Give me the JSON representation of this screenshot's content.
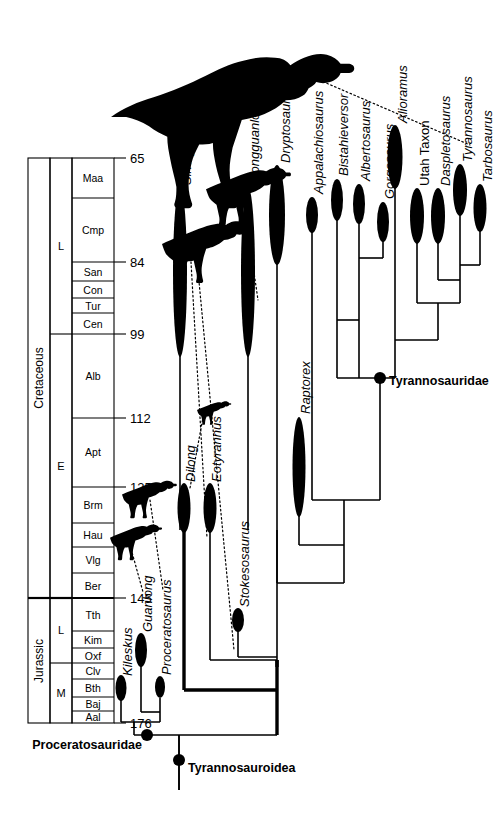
{
  "figure": {
    "type": "cladogram-timescale"
  },
  "axis": {
    "unit": "Ma",
    "tick_labels": [
      "65",
      "84",
      "99",
      "112",
      "125",
      "145",
      "176"
    ],
    "ticks": [
      {
        "label": "65",
        "value": 65
      },
      {
        "label": "84",
        "value": 84
      },
      {
        "label": "99",
        "value": 99
      },
      {
        "label": "112",
        "value": 112
      },
      {
        "label": "125",
        "value": 125
      },
      {
        "label": "145",
        "value": 145
      },
      {
        "label": "176",
        "value": 176
      }
    ]
  },
  "timescale": {
    "periods": [
      {
        "name": "Cretaceous",
        "top": 65,
        "bottom": 145
      },
      {
        "name": "Jurassic",
        "top": 145,
        "bottom": 176
      }
    ],
    "epochs": [
      {
        "name": "L",
        "period": "Cretaceous",
        "top": 65,
        "bottom": 99
      },
      {
        "name": "E",
        "period": "Cretaceous",
        "top": 99,
        "bottom": 145
      },
      {
        "name": "L",
        "period": "Jurassic",
        "top": 145,
        "bottom": 161
      },
      {
        "name": "M",
        "period": "Jurassic",
        "top": 161,
        "bottom": 176
      }
    ],
    "stages": [
      {
        "name": "Maa",
        "top": 65,
        "bottom": 70.6
      },
      {
        "name": "Cmp",
        "top": 70.6,
        "bottom": 84
      },
      {
        "name": "San",
        "top": 84,
        "bottom": 86
      },
      {
        "name": "Con",
        "top": 86,
        "bottom": 88.5
      },
      {
        "name": "Tur",
        "top": 88.5,
        "bottom": 91
      },
      {
        "name": "Cen",
        "top": 91,
        "bottom": 99
      },
      {
        "name": "Alb",
        "top": 99,
        "bottom": 112
      },
      {
        "name": "Apt",
        "top": 112,
        "bottom": 125
      },
      {
        "name": "Brm",
        "top": 125,
        "bottom": 130
      },
      {
        "name": "Hau",
        "top": 130,
        "bottom": 134
      },
      {
        "name": "Vlg",
        "top": 134,
        "bottom": 140
      },
      {
        "name": "Ber",
        "top": 140,
        "bottom": 145
      },
      {
        "name": "Tth",
        "top": 145,
        "bottom": 151
      },
      {
        "name": "Kim",
        "top": 151,
        "bottom": 155
      },
      {
        "name": "Oxf",
        "top": 155,
        "bottom": 158
      },
      {
        "name": "Clv",
        "top": 158,
        "bottom": 162
      },
      {
        "name": "Bth",
        "top": 162,
        "bottom": 167
      },
      {
        "name": "Baj",
        "top": 167,
        "bottom": 171
      },
      {
        "name": "Aal",
        "top": 171,
        "bottom": 176
      }
    ]
  },
  "taxa": [
    {
      "name": "Kileskus",
      "italic": true,
      "range_top": 166,
      "range_bottom": 172
    },
    {
      "name": "Guanlong",
      "italic": true,
      "range_top": 156,
      "range_bottom": 164
    },
    {
      "name": "Proceratosaurus",
      "italic": true,
      "range_top": 163,
      "range_bottom": 168
    },
    {
      "name": "Dilong",
      "italic": true,
      "range_top": 124,
      "range_bottom": 131
    },
    {
      "name": "Eotyrannus",
      "italic": true,
      "range_top": 124,
      "range_bottom": 131
    },
    {
      "name": "Stokesosaurus",
      "italic": true,
      "range_top": 150,
      "range_bottom": 154
    },
    {
      "name": "Sinotyrannus",
      "italic": true,
      "range_top": 96,
      "range_bottom": 124
    },
    {
      "name": "Xiongguanlong",
      "italic": true,
      "range_top": 96,
      "range_bottom": 124
    },
    {
      "name": "Dryptosaurus",
      "italic": true,
      "range_top": 66,
      "range_bottom": 95
    },
    {
      "name": "Raptorex",
      "italic": true,
      "range_top": 105,
      "range_bottom": 128
    },
    {
      "name": "Appalachiosaurus",
      "italic": true,
      "range_top": 76,
      "range_bottom": 82
    },
    {
      "name": "Bistahieversor",
      "italic": true,
      "range_top": 72,
      "range_bottom": 79
    },
    {
      "name": "Albertosaurus",
      "italic": true,
      "range_top": 72,
      "range_bottom": 79
    },
    {
      "name": "Gorgosaurus",
      "italic": true,
      "range_top": 75,
      "range_bottom": 82
    },
    {
      "name": "Alioramus",
      "italic": true,
      "range_top": 67,
      "range_bottom": 79
    },
    {
      "name": "Utah Taxon",
      "italic": false,
      "range_top": 71,
      "range_bottom": 81
    },
    {
      "name": "Daspletosaurus",
      "italic": true,
      "range_top": 71,
      "range_bottom": 81
    },
    {
      "name": "Tyrannosaurus",
      "italic": true,
      "range_top": 67,
      "range_bottom": 76
    },
    {
      "name": "Tarbosaurus",
      "italic": true,
      "range_top": 70,
      "range_bottom": 78
    }
  ],
  "clades": [
    {
      "name": "Proceratosauridae",
      "anchor": "left"
    },
    {
      "name": "Tyrannosauroidea",
      "anchor": "right"
    },
    {
      "name": "Tyrannosauridae",
      "anchor": "right"
    }
  ],
  "silhouettes": [
    {
      "name": "dryptosaurus-silhouette",
      "taxon": "Dryptosaurus"
    },
    {
      "name": "xiongguanlong-silhouette",
      "taxon": "Xiongguanlong"
    },
    {
      "name": "sinotyrannus-silhouette",
      "taxon": "Sinotyrannus"
    },
    {
      "name": "dilong-silhouette",
      "taxon": "Dilong"
    },
    {
      "name": "proceratosaurus-silhouette",
      "taxon": "Proceratosaurus"
    },
    {
      "name": "guanlong-silhouette",
      "taxon": "Guanlong"
    }
  ],
  "colors": {
    "line": "#000000",
    "fill": "#000000",
    "background": "#ffffff"
  }
}
